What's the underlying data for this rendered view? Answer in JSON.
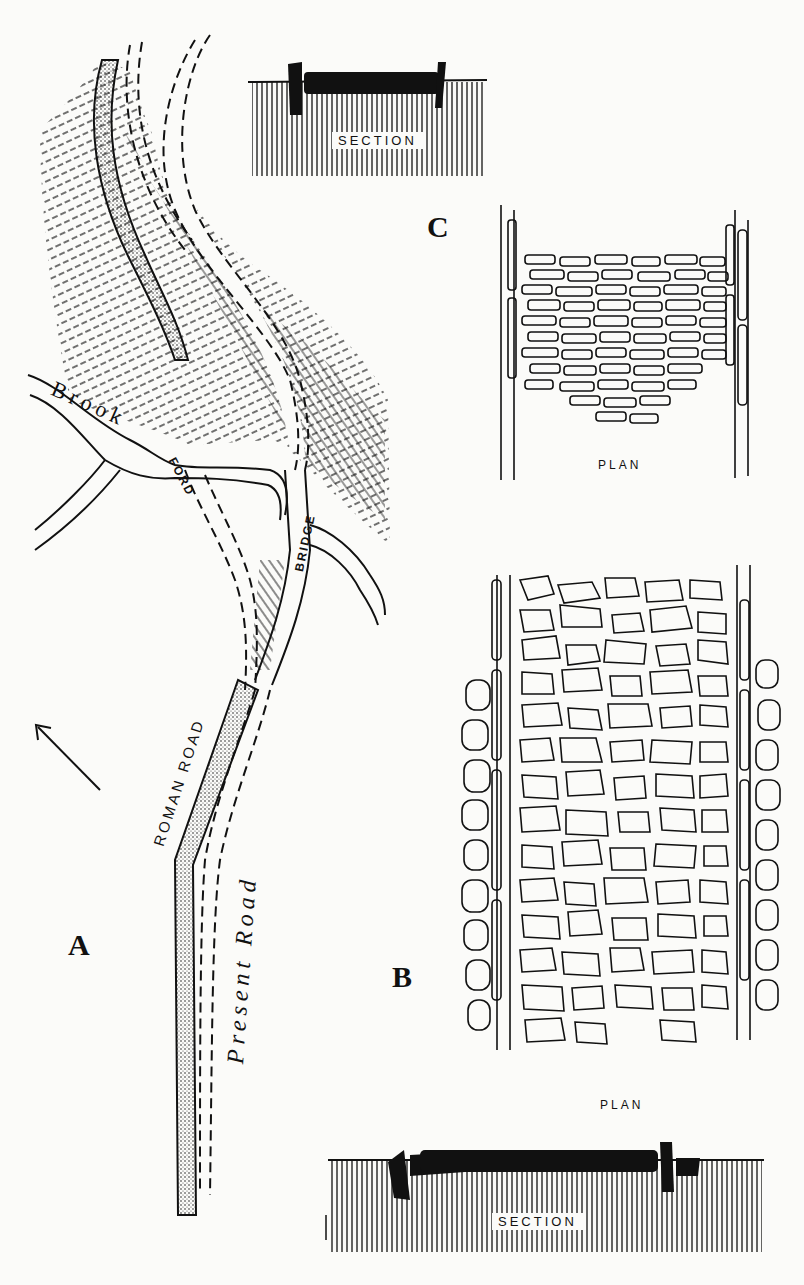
{
  "figure": {
    "panel_labels": {
      "a": "A",
      "b": "B",
      "c": "C"
    },
    "map": {
      "brook_label": "Brook",
      "ford_label": "FORD",
      "bridge_label": "BRIDGE",
      "roman_road_label": "ROMAN ROAD",
      "present_road_label": "Present Road",
      "north_arrow": "north-arrow"
    },
    "panel_c": {
      "section_label": "SECTION",
      "plan_label": "PLAN"
    },
    "panel_b": {
      "plan_label": "PLAN",
      "section_label": "SECTION"
    },
    "colors": {
      "ink": "#111111",
      "paper": "#fbfbf9"
    }
  }
}
